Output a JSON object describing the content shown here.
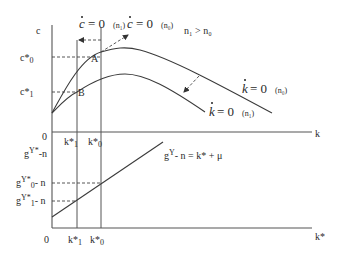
{
  "diagram": {
    "top_panel": {
      "y_axis_label": "c",
      "x_axis_label": "k",
      "origin_label": "0",
      "condition_note": "n₁ > n₀",
      "y_ticks": [
        {
          "label": "c*₀",
          "base": "c*",
          "sub": "0"
        },
        {
          "label": "c*₁",
          "base": "c*",
          "sub": "1"
        }
      ],
      "x_ticks": [
        {
          "label": "k*₁",
          "base": "k*",
          "sub": "1"
        },
        {
          "label": "k*₀",
          "base": "k*",
          "sub": "0"
        }
      ],
      "points": [
        {
          "label": "A"
        },
        {
          "label": "B"
        }
      ],
      "curves": {
        "cdot_n1": {
          "lhs": "c",
          "eq": "= 0",
          "param": "(n₁)"
        },
        "cdot_n0": {
          "lhs": "c",
          "eq": "= 0",
          "param": "(n₀)"
        },
        "kdot_n0": {
          "lhs": "k",
          "eq": "= 0",
          "param": "(n₀)"
        },
        "kdot_n1": {
          "lhs": "k",
          "eq": "= 0",
          "param": "(n₁)"
        }
      }
    },
    "bottom_panel": {
      "x_axis_label": "k*",
      "origin_label": "0",
      "y_axis_title": {
        "g": "g",
        "sup": "Y*",
        "rest": "-n"
      },
      "y_ticks": [
        {
          "g": "g",
          "sup": "Y*",
          "sub": "0",
          "rest": "- n"
        },
        {
          "g": "g",
          "sup": "Y*",
          "sub": "1",
          "rest": "- n"
        }
      ],
      "x_ticks": [
        {
          "base": "k*",
          "sub": "1"
        },
        {
          "base": "k*",
          "sub": "0"
        }
      ],
      "line_equation": {
        "g": "g",
        "sup": "Y",
        "rest": "- n =  k* + μ"
      }
    }
  }
}
